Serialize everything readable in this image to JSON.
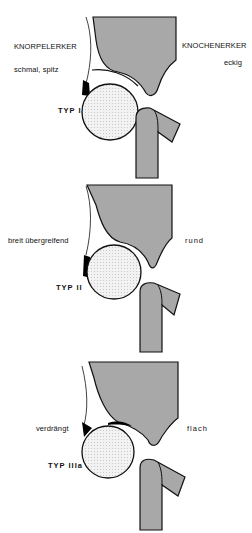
{
  "panels": [
    {
      "type_label": "TYP I",
      "left_heading": "KNORPELERKER",
      "left_desc": "schmal, spitz",
      "right_heading": "KNOCHENERKER",
      "right_desc": "eckig"
    },
    {
      "type_label": "TYP II",
      "left_desc": "breit übergreifend",
      "right_desc": "rund"
    },
    {
      "type_label": "TYP IIIa",
      "left_desc": "verdrängt",
      "right_desc": "flach"
    }
  ],
  "colors": {
    "bone": "#a8a8a8",
    "outline": "#111111",
    "cartilage": "#000000",
    "femoral_head": "#ececec"
  }
}
